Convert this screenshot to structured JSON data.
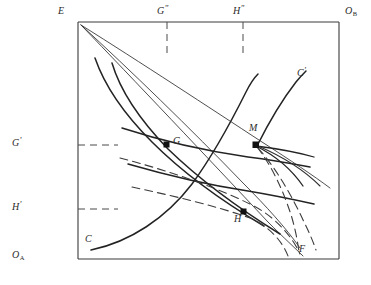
{
  "figure": {
    "kind": "edgeworth-box-contract-curve-diagram",
    "background_color": "#ffffff",
    "ink_color": "#2b2b2b"
  },
  "box": {
    "left": 78,
    "top": 22,
    "right": 339,
    "bottom": 259,
    "border_color": "#3a3a3a"
  },
  "corner_labels": {
    "origin_a": {
      "text": "O",
      "sub": "A",
      "x": 12,
      "y": 254
    },
    "origin_b": {
      "text": "O",
      "sub": "B",
      "x": 345,
      "y": 8
    },
    "endowment": {
      "text": "E",
      "x": 58,
      "y": 8
    }
  },
  "axis_ticks": {
    "left": [
      {
        "label": "G",
        "prime": "'",
        "x": 10,
        "y": 139,
        "tick_y": 145,
        "dash_to_x": 118
      },
      {
        "label": "H",
        "prime": "'",
        "x": 10,
        "y": 203,
        "tick_y": 209,
        "dash_to_x": 118
      }
    ],
    "top": [
      {
        "label": "G",
        "prime": "\"",
        "x": 157,
        "y": 8,
        "tick_x": 167,
        "dash_to_y": 55
      },
      {
        "label": "H",
        "prime": "\"",
        "x": 233,
        "y": 8,
        "tick_x": 243,
        "dash_to_y": 55
      }
    ]
  },
  "points": [
    {
      "name": "G",
      "label": "G",
      "x": 167,
      "y": 145,
      "label_x": 173,
      "label_y": 139,
      "marker": "filled-square"
    },
    {
      "name": "M",
      "label": "M",
      "x": 256,
      "y": 145,
      "label_x": 249,
      "label_y": 127,
      "marker": "filled-square"
    },
    {
      "name": "H",
      "label": "H",
      "x": 244,
      "y": 212,
      "label_x": 236,
      "label_y": 215,
      "marker": "filled-square"
    }
  ],
  "curve_labels": [
    {
      "name": "C",
      "text": "C",
      "x": 85,
      "y": 238
    },
    {
      "name": "C-prime",
      "text": "C",
      "prime": "'",
      "x": 298,
      "y": 70
    },
    {
      "name": "F",
      "text": "F",
      "x": 300,
      "y": 246
    }
  ],
  "curves": {
    "contract_curve_CCprime": "M 92,250 C 140,240 178,215 206,172 C 232,132 250,100 258,140 C 268,112 285,88 305,74",
    "indifference_A_1": "M 95,57 C 110,80 132,110 160,139 C 192,172 228,200 268,226",
    "indifference_A_2": "M 110,62 C 124,86 146,116 176,146 C 208,178 240,205 276,232",
    "indifference_B_1": "M 123,129 C 160,142 205,152 246,158 C 268,161 290,165 308,168",
    "indifference_B_2": "M 128,165 C 165,176 208,186 248,192 C 272,196 295,200 315,204",
    "ray_E_to_F": "M 80,24 C 140,92 230,178 302,250",
    "ray_E_to_M_extended": "M 80,24 C 130,62 200,112 260,150 C 285,166 308,180 322,190",
    "ray_E_to_Fprime": "M 80,24 C 136,82 218,162 292,252",
    "dashed_budget_1": "M 122,160 C 170,172 218,190 266,218 C 282,228 294,240 302,252",
    "dashed_budget_2": "M 130,190 C 172,199 214,208 250,218 C 270,224 284,238 290,254",
    "price_line_through_M": "M 80,24 C 140,70 210,118 256,145 C 288,164 312,180 330,192"
  }
}
